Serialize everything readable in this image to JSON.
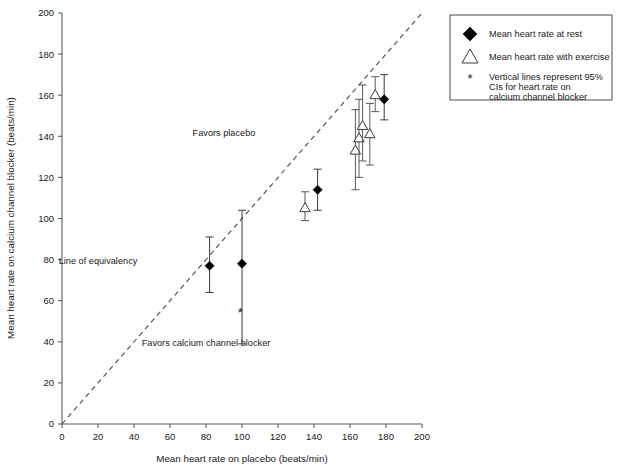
{
  "chart_data": {
    "type": "scatter",
    "title": "",
    "xlabel": "Mean heart rate on placebo (beats/min)",
    "ylabel": "Mean heart rate on calcium channel blocker (beats/min)",
    "xlim": [
      0,
      200
    ],
    "ylim": [
      0,
      200
    ],
    "xticks": [
      0,
      20,
      40,
      60,
      80,
      100,
      120,
      140,
      160,
      180,
      200
    ],
    "yticks": [
      0,
      20,
      40,
      60,
      80,
      100,
      120,
      140,
      160,
      180,
      200
    ],
    "grid": false,
    "legend_position": "top-right",
    "reference_line": {
      "label": "Line of equivalency",
      "style": "dashed",
      "from": [
        0,
        0
      ],
      "to": [
        200,
        200
      ]
    },
    "annotations": [
      {
        "text": "Favors placebo",
        "x": 90,
        "y": 140
      },
      {
        "text": "Line of equivalency",
        "x": 20,
        "y": 78
      },
      {
        "text": "Favors calcium channel blocker",
        "x": 80,
        "y": 38
      }
    ],
    "series": [
      {
        "name": "Mean heart rate at rest",
        "marker": "filled-diamond",
        "points": [
          {
            "x": 82,
            "y": 77,
            "ci_low": 64,
            "ci_high": 91
          },
          {
            "x": 100,
            "y": 78,
            "ci_low": 39,
            "ci_high": 104
          },
          {
            "x": 142,
            "y": 114,
            "ci_low": 104,
            "ci_high": 124
          },
          {
            "x": 179,
            "y": 158,
            "ci_low": 148,
            "ci_high": 170
          }
        ]
      },
      {
        "name": "Mean heart rate with exercise",
        "marker": "open-triangle",
        "points": [
          {
            "x": 135,
            "y": 105,
            "ci_low": 99,
            "ci_high": 113
          },
          {
            "x": 163,
            "y": 133,
            "ci_low": 114,
            "ci_high": 153
          },
          {
            "x": 165,
            "y": 139,
            "ci_low": 120,
            "ci_high": 158
          },
          {
            "x": 167,
            "y": 145,
            "ci_low": 128,
            "ci_high": 165
          },
          {
            "x": 171,
            "y": 141,
            "ci_low": 126,
            "ci_high": 156
          },
          {
            "x": 174,
            "y": 160,
            "ci_low": 152,
            "ci_high": 169
          }
        ]
      }
    ],
    "extra_markers": [
      {
        "glyph": "star",
        "x": 99,
        "y": 54
      }
    ]
  },
  "legend": {
    "items": [
      {
        "icon": "filled-diamond-icon",
        "label": "Mean heart rate at rest"
      },
      {
        "icon": "open-triangle-icon",
        "label": "Mean heart rate with exercise"
      },
      {
        "icon": "star-icon",
        "label_line1": "Vertical lines represent 95%",
        "label_line2": "CIs for heart rate on",
        "label_line3": "calcium channel blocker"
      }
    ]
  }
}
